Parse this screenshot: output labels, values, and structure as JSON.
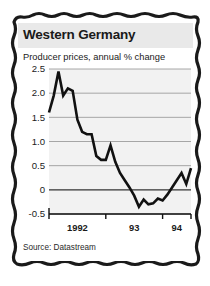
{
  "card": {
    "title": "Western Germany",
    "subtitle": "Producer prices, annual % change",
    "source": "Source: Datastream"
  },
  "colors": {
    "title_band": "#e9e9e9",
    "card_background": "#ffffff",
    "plot_background": "#f2f2f2",
    "line": "#111111",
    "gridline": "#8c8c8c",
    "zero_line": "#333333",
    "axis": "#111111",
    "text": "#1a1a1a",
    "page_background": "#ffffff",
    "frame": "#1a1a1a"
  },
  "chart_data": {
    "type": "line",
    "title": "Western Germany",
    "subtitle": "Producer prices, annual % change",
    "xlabel": "",
    "ylabel": "annual % change",
    "ylim": [
      -0.5,
      2.5
    ],
    "yticks": [
      2.5,
      2.0,
      1.5,
      1.0,
      0.5,
      0,
      -0.5
    ],
    "ytick_labels": [
      "2.5",
      "2.0",
      "1.5",
      "1.0",
      "0.5",
      "0",
      "-0.5"
    ],
    "xlim": [
      0,
      30
    ],
    "xtick_positions": [
      0,
      12,
      24,
      30
    ],
    "xtick_labels": [
      "1992",
      "93",
      "94"
    ],
    "xtick_label_positions": [
      6,
      18,
      27
    ],
    "grid": true,
    "legend": false,
    "zero_line": true,
    "series": [
      {
        "name": "Producer prices, annual % change",
        "x": [
          0,
          1,
          2,
          3,
          4,
          5,
          6,
          7,
          8,
          9,
          10,
          11,
          12,
          13,
          14,
          15,
          16,
          17,
          18,
          19,
          20,
          21,
          22,
          23,
          24,
          25,
          26,
          27,
          28,
          29,
          30
        ],
        "values": [
          1.6,
          1.95,
          2.45,
          1.95,
          2.1,
          2.05,
          1.45,
          1.2,
          1.15,
          1.15,
          0.7,
          0.62,
          0.62,
          0.92,
          0.58,
          0.35,
          0.2,
          0.05,
          -0.12,
          -0.35,
          -0.2,
          -0.3,
          -0.28,
          -0.18,
          -0.22,
          -0.1,
          0.05,
          0.2,
          0.35,
          0.12,
          0.45
        ]
      }
    ]
  }
}
